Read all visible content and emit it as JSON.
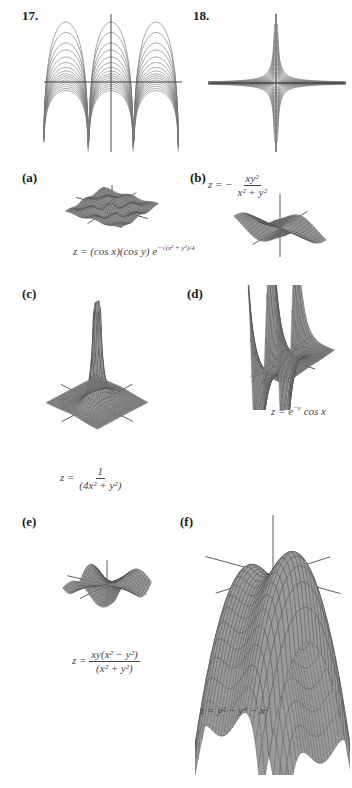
{
  "page": {
    "exercise_labels": {
      "fig17": "17.",
      "fig18": "18."
    },
    "panel_labels": {
      "a": "(a)",
      "b": "(b)",
      "c": "(c)",
      "d": "(d)",
      "e": "(e)",
      "f": "(f)"
    }
  },
  "colors": {
    "surface": "#9a9a9a",
    "mesh": "#4a4a4a",
    "contour": "#7a7a7a",
    "axis": "#333333"
  },
  "formulas": {
    "a": {
      "lhs": "z = (cos x)(cos y) e",
      "exp": "−√(x² + y²)/4"
    },
    "b": {
      "lhs": "z = −",
      "num": "xy²",
      "den": "x² + y²"
    },
    "c": {
      "lhs": "z =",
      "num": "1",
      "den": "(4x² + y²)"
    },
    "d": {
      "text": "z = e",
      "exp": "−y",
      "tail": " cos x"
    },
    "e": {
      "lhs": "z =",
      "num": "xy(x² − y²)",
      "den": "(x² + y²)"
    },
    "f": {
      "text": "z = y² − y⁴ − x²"
    }
  },
  "chart_data": [
    {
      "type": "contour",
      "id": "17",
      "title": "17.",
      "description": "Level curves (arch-shaped, two cusps at bottom)",
      "axes": "x and y axes shown"
    },
    {
      "type": "contour",
      "id": "18",
      "title": "18.",
      "description": "Level curves of hyperbolic family (saddle-like, four quadrants)",
      "axes": "x and y axes shown"
    },
    {
      "type": "surface",
      "id": "a",
      "function": "z = (cos x)(cos y) e^(-sqrt(x^2+y^2)/4)"
    },
    {
      "type": "surface",
      "id": "b",
      "function": "z = -xy^2/(x^2+y^2)"
    },
    {
      "type": "surface",
      "id": "c",
      "function": "z = 1/(4x^2+y^2)"
    },
    {
      "type": "surface",
      "id": "d",
      "function": "z = e^(-y) cos x"
    },
    {
      "type": "surface",
      "id": "e",
      "function": "z = xy(x^2-y^2)/(x^2+y^2)"
    },
    {
      "type": "surface",
      "id": "f",
      "function": "z = y^2 - y^4 - x^2"
    }
  ]
}
